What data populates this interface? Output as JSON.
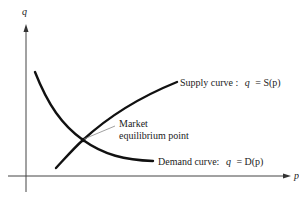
{
  "diagram": {
    "axes": {
      "y_label": "q",
      "x_label": "p"
    },
    "curves": {
      "supply": {
        "label": "Supply curve :",
        "equation_lhs": "q",
        "equation_rhs": "= S(p)"
      },
      "demand": {
        "label": "Demand curve:",
        "equation_lhs": "q",
        "equation_rhs": "= D(p)"
      }
    },
    "equilibrium": {
      "label_line1": "Market",
      "label_line2": "equilibrium point"
    },
    "colors": {
      "curve": "#111111",
      "axis": "#444444",
      "leader": "#888888"
    }
  }
}
